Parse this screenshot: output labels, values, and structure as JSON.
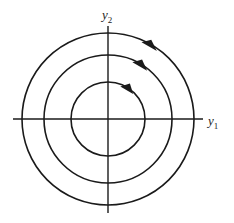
{
  "diagram": {
    "type": "phase-portrait",
    "axes": {
      "x_label": "y",
      "x_label_sub": "1",
      "y_label": "y",
      "y_label_sub": "2"
    },
    "center": [
      108,
      119
    ],
    "orbits": [
      {
        "radius": 37,
        "direction": "counter-clockwise"
      },
      {
        "radius": 64,
        "direction": "counter-clockwise"
      },
      {
        "radius": 86,
        "direction": "counter-clockwise"
      }
    ],
    "colors": {
      "stroke": "#1a1a1a",
      "background": "#ffffff"
    }
  }
}
